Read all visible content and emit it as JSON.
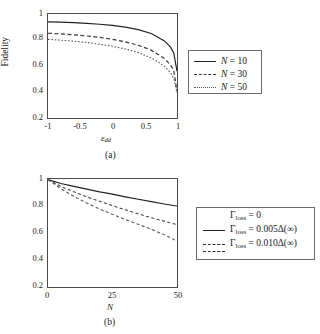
{
  "figure": {
    "panels": [
      {
        "id": "a",
        "caption": "(a)",
        "xlabel_base": "ε",
        "xlabel_sub": "dd",
        "ylabel": "Fidelity",
        "xticks": [
          "-1",
          "-0.5",
          "0",
          "0.5",
          "1"
        ],
        "yticks": [
          "0.2",
          "0.4",
          "0.6",
          "0.8",
          "1"
        ],
        "legend": [
          {
            "label_var": "N",
            "label_eq": " = ",
            "label_val": "10",
            "style": "solid"
          },
          {
            "label_var": "N",
            "label_eq": " = ",
            "label_val": "30",
            "style": "dashed"
          },
          {
            "label_var": "N",
            "label_eq": " = ",
            "label_val": "50",
            "style": "dotted"
          }
        ]
      },
      {
        "id": "b",
        "caption": "(b)",
        "xlabel_base": "N",
        "xlabel_sub": "",
        "ylabel": "",
        "xticks": [
          "0",
          "25",
          "50"
        ],
        "yticks": [
          "0.2",
          "0.4",
          "0.6",
          "0.8",
          "1"
        ],
        "legend": [
          {
            "label_var": "Γ",
            "label_sub": "loss",
            "label_eq": " = ",
            "label_val": "0",
            "style": "solid"
          },
          {
            "label_var": "Γ",
            "label_sub": "loss",
            "label_eq": " = ",
            "label_val": "0.005Δ(∞)",
            "style": "dashed"
          },
          {
            "label_var": "Γ",
            "label_sub": "loss",
            "label_eq": " = ",
            "label_val": "0.010Δ(∞)",
            "style": "dotted"
          }
        ]
      }
    ]
  },
  "chart_data": [
    {
      "type": "line",
      "panel": "a",
      "title": "",
      "xlabel": "ε_dd",
      "ylabel": "Fidelity",
      "xlim": [
        -1,
        1
      ],
      "ylim": [
        0.2,
        1
      ],
      "xticks": [
        -1,
        -0.5,
        0,
        0.5,
        1
      ],
      "yticks": [
        0.2,
        0.4,
        0.6,
        0.8,
        1
      ],
      "grid": false,
      "legend_position": "right-outside",
      "x": [
        -1,
        -0.8,
        -0.6,
        -0.4,
        -0.2,
        0,
        0.2,
        0.4,
        0.6,
        0.8,
        0.9,
        0.95,
        1
      ],
      "series": [
        {
          "name": "N = 10",
          "style": "solid",
          "values": [
            0.94,
            0.937,
            0.933,
            0.928,
            0.921,
            0.912,
            0.899,
            0.88,
            0.85,
            0.795,
            0.745,
            0.7,
            0.56
          ]
        },
        {
          "name": "N = 30",
          "style": "dashed",
          "values": [
            0.852,
            0.847,
            0.84,
            0.831,
            0.82,
            0.805,
            0.786,
            0.76,
            0.722,
            0.66,
            0.608,
            0.565,
            0.405
          ]
        },
        {
          "name": "N = 50",
          "style": "dotted",
          "values": [
            0.805,
            0.799,
            0.791,
            0.781,
            0.768,
            0.752,
            0.731,
            0.703,
            0.663,
            0.6,
            0.548,
            0.505,
            0.395
          ]
        }
      ]
    },
    {
      "type": "line",
      "panel": "b",
      "title": "",
      "xlabel": "N",
      "ylabel": "Fidelity",
      "xlim": [
        0,
        50
      ],
      "ylim": [
        0.2,
        1
      ],
      "xticks": [
        0,
        25,
        50
      ],
      "yticks": [
        0.2,
        0.4,
        0.6,
        0.8,
        1
      ],
      "grid": false,
      "legend_position": "right-outside",
      "x": [
        0,
        5,
        10,
        15,
        20,
        25,
        30,
        35,
        40,
        45,
        50
      ],
      "series": [
        {
          "name": "Gamma_loss = 0",
          "style": "solid",
          "values": [
            0.995,
            0.967,
            0.945,
            0.925,
            0.905,
            0.888,
            0.868,
            0.85,
            0.832,
            0.815,
            0.8
          ]
        },
        {
          "name": "Gamma_loss = 0.005*Delta(inf)",
          "style": "dashed",
          "values": [
            0.995,
            0.945,
            0.905,
            0.868,
            0.835,
            0.802,
            0.772,
            0.742,
            0.713,
            0.688,
            0.662
          ]
        },
        {
          "name": "Gamma_loss = 0.010*Delta(inf)",
          "style": "dotted",
          "values": [
            0.995,
            0.928,
            0.872,
            0.822,
            0.778,
            0.738,
            0.7,
            0.664,
            0.628,
            0.588,
            0.54
          ]
        }
      ]
    }
  ]
}
